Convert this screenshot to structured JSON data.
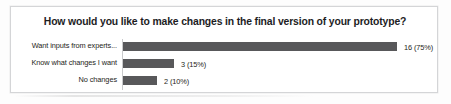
{
  "chart_data": {
    "type": "bar",
    "orientation": "horizontal",
    "title": "How would you like to make changes in the final version of your prototype?",
    "xlabel": "",
    "ylabel": "",
    "categories": [
      "Want inputs from experts...",
      "Know what changes I want",
      "No changes"
    ],
    "values": [
      16,
      3,
      2
    ],
    "percentages": [
      75,
      15,
      10
    ],
    "data_labels": [
      "16 (75%)",
      "3 (15%)",
      "2 (10%)"
    ],
    "xlim": [
      0,
      16
    ],
    "grid": false,
    "legend": false,
    "series": [
      {
        "name": "Responses",
        "values": [
          16,
          3,
          2
        ]
      }
    ],
    "bar_color": "#58585a",
    "plot_background": "#ffffff",
    "axis_line_color": "#c9cacc",
    "frame_border_color": "#d4d5d7",
    "title_color": "#1d1d1f",
    "label_color": "#1e1e20"
  }
}
